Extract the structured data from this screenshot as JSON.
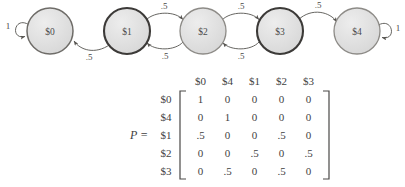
{
  "diagram": {
    "name": "markov-chain-state-diagram",
    "nodes": [
      {
        "id": "s0",
        "label": "$0",
        "cx": 50,
        "cy": 31,
        "r": 23,
        "border": "medium"
      },
      {
        "id": "s1",
        "label": "$1",
        "cx": 127,
        "cy": 31,
        "r": 23,
        "border": "dark"
      },
      {
        "id": "s2",
        "label": "$2",
        "cx": 203,
        "cy": 31,
        "r": 23,
        "border": "light"
      },
      {
        "id": "s3",
        "label": "$3",
        "cx": 280,
        "cy": 31,
        "r": 23,
        "border": "dark"
      },
      {
        "id": "s4",
        "label": "$4",
        "cx": 357,
        "cy": 31,
        "r": 23,
        "border": "light"
      }
    ],
    "self_loops": [
      {
        "id": "loop-s0",
        "on": "$0",
        "label": "1",
        "side": "left"
      },
      {
        "id": "loop-s4",
        "on": "$4",
        "label": "1",
        "side": "right"
      }
    ],
    "edges": [
      {
        "id": "e-s1-s0",
        "from": "$1",
        "to": "$0",
        "label": ".5"
      },
      {
        "id": "e-s1-s2",
        "from": "$1",
        "to": "$2",
        "label": ".5"
      },
      {
        "id": "e-s2-s1",
        "from": "$2",
        "to": "$1",
        "label": ".5"
      },
      {
        "id": "e-s2-s3",
        "from": "$2",
        "to": "$3",
        "label": ".5"
      },
      {
        "id": "e-s3-s2",
        "from": "$3",
        "to": "$2",
        "label": ".5"
      },
      {
        "id": "e-s3-s4",
        "from": "$3",
        "to": "$4",
        "label": ".5"
      }
    ]
  },
  "matrix": {
    "name": "transition-matrix",
    "p_label": "P  =",
    "col_headers": [
      "$0",
      "$4",
      "$1",
      "$2",
      "$3"
    ],
    "row_headers": [
      "$0",
      "$4",
      "$1",
      "$2",
      "$3"
    ],
    "rows": [
      [
        "1",
        "0",
        "0",
        "0",
        "0"
      ],
      [
        "0",
        "1",
        "0",
        "0",
        "0"
      ],
      [
        ".5",
        "0",
        "0",
        ".5",
        "0"
      ],
      [
        "0",
        "0",
        ".5",
        "0",
        ".5"
      ],
      [
        "0",
        ".5",
        "0",
        ".5",
        "0"
      ]
    ]
  },
  "colors": {
    "node_fill": "#dcdcdc",
    "node_stroke_dark": "#3c3a38",
    "node_stroke_medium": "#6e6c68",
    "node_stroke_light": "#8d8b87",
    "edge_stroke": "#55534f",
    "text": "#3f3f3f",
    "background": "#ffffff"
  }
}
